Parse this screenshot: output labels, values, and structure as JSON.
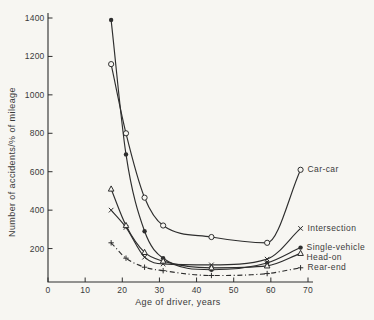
{
  "figure": {
    "background": "#f7f6f2",
    "ink": "#2e2e2e",
    "text_color": "#3a3a3a"
  },
  "chart_data": {
    "type": "line",
    "title": "",
    "xlabel": "Age of driver, years",
    "ylabel": "Number of accidents/% of mileage",
    "xlim": [
      0,
      70
    ],
    "ylim": [
      0,
      1400
    ],
    "xticks": [
      0,
      10,
      20,
      30,
      40,
      50,
      60,
      70
    ],
    "yticks": [
      200,
      400,
      600,
      800,
      1000,
      1200,
      1400
    ],
    "grid": false,
    "legend_position": "labels-at-line-ends",
    "x": [
      17,
      21,
      26,
      31,
      44,
      59,
      68
    ],
    "series": [
      {
        "name": "Car-car",
        "marker": "open-circle",
        "line": "solid",
        "values": [
          1160,
          800,
          465,
          320,
          260,
          230,
          610
        ],
        "label_offset": [
          7,
          2.5
        ]
      },
      {
        "name": "Intersection",
        "marker": "x",
        "line": "solid",
        "values": [
          400,
          310,
          155,
          120,
          115,
          145,
          305
        ],
        "label_offset": [
          7,
          3
        ]
      },
      {
        "name": "Single-vehicle",
        "marker": "filled-circle",
        "line": "solid",
        "values": [
          1390,
          690,
          290,
          150,
          90,
          125,
          205
        ],
        "label_offset": [
          6,
          2.5
        ]
      },
      {
        "name": "Head-on",
        "marker": "open-triangle",
        "line": "solid",
        "values": [
          510,
          320,
          180,
          135,
          100,
          110,
          175
        ],
        "label_offset": [
          6,
          6.5
        ]
      },
      {
        "name": "Rear-end",
        "marker": "plus",
        "line": "dash-dot",
        "values": [
          230,
          150,
          103,
          85,
          60,
          70,
          100
        ],
        "label_offset": [
          7,
          2.5
        ]
      }
    ]
  }
}
